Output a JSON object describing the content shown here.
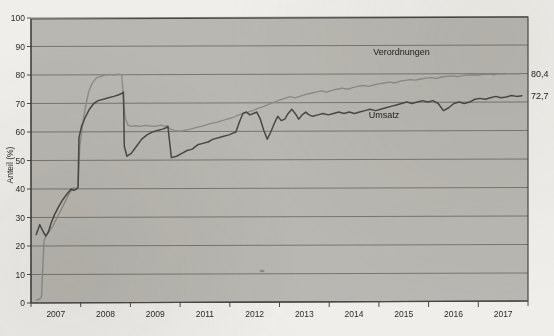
{
  "chart_data": {
    "type": "line",
    "title": "",
    "xlabel": "",
    "ylabel": "Anteil (%)",
    "ylim": [
      0,
      100
    ],
    "yticks": [
      0,
      10,
      20,
      30,
      40,
      50,
      60,
      70,
      80,
      90,
      100
    ],
    "ytick_labels": [
      "0",
      "10",
      "20",
      "30",
      "40",
      "50",
      "60",
      "70",
      "80",
      "90",
      "100"
    ],
    "xtick_labels": [
      "2007",
      "2008",
      "2009",
      "2011",
      "2012",
      "2013",
      "2014",
      "2015",
      "2016",
      "2017"
    ],
    "xlim": [
      2006.5,
      2017.9
    ],
    "grid": true,
    "legend_position": "inline-annotations",
    "annotations": [
      {
        "name": "verordnungen-label",
        "text": "Verordnungen",
        "x": 2015.0,
        "y": 88.0
      },
      {
        "name": "umsatz-label",
        "text": "Umsatz",
        "x": 2014.6,
        "y": 66.0
      },
      {
        "name": "verordnungen-endvalue",
        "text": "80,4",
        "x": 2018.1,
        "y": 80.4
      },
      {
        "name": "umsatz-endvalue",
        "text": "72,7",
        "x": 2018.1,
        "y": 72.7
      }
    ],
    "series": [
      {
        "name": "Verordnungen",
        "end_label": "80,4",
        "final_value": 80.4,
        "color": "#8d8b85",
        "x": [
          2006.62,
          2006.66,
          2006.7,
          2006.74,
          2006.8,
          2006.86,
          2006.92,
          2007.0,
          2007.1,
          2007.2,
          2007.3,
          2007.4,
          2007.48,
          2007.54,
          2007.58,
          2007.62,
          2007.68,
          2007.74,
          2007.82,
          2007.9,
          2008.0,
          2008.1,
          2008.2,
          2008.3,
          2008.4,
          2008.5,
          2008.58,
          2008.62,
          2008.66,
          2008.72,
          2008.8,
          2008.9,
          2009.0,
          2009.12,
          2009.24,
          2009.36,
          2009.48,
          2009.58,
          2009.62,
          2009.7,
          2009.8,
          2009.92,
          2010.04,
          2010.16,
          2010.28,
          2010.4,
          2010.52,
          2010.64,
          2010.76,
          2010.88,
          2011.0,
          2011.12,
          2011.24,
          2011.36,
          2011.48,
          2011.6,
          2011.72,
          2011.84,
          2011.96,
          2012.08,
          2012.2,
          2012.32,
          2012.44,
          2012.56,
          2012.68,
          2012.8,
          2012.92,
          2013.04,
          2013.16,
          2013.28,
          2013.4,
          2013.52,
          2013.64,
          2013.76,
          2013.88,
          2014.0,
          2014.12,
          2014.24,
          2014.36,
          2014.48,
          2014.6,
          2014.72,
          2014.84,
          2014.96,
          2015.08,
          2015.2,
          2015.32,
          2015.44,
          2015.56,
          2015.68,
          2015.8,
          2015.92,
          2016.04,
          2016.16,
          2016.28,
          2016.4,
          2016.52,
          2016.64,
          2016.76,
          2016.88,
          2017.0,
          2017.12,
          2017.24,
          2017.36,
          2017.48,
          2017.6,
          2017.72
        ],
        "y": [
          1.0,
          1.2,
          1.4,
          2.0,
          22.0,
          24.0,
          25.0,
          27.0,
          30.0,
          33.0,
          36.0,
          39.0,
          40.5,
          40.0,
          41.0,
          55.0,
          62.0,
          68.0,
          74.0,
          77.0,
          79.0,
          79.5,
          80.0,
          80.2,
          80.0,
          80.3,
          80.1,
          72.0,
          65.0,
          62.5,
          62.0,
          62.2,
          62.0,
          62.3,
          62.1,
          62.0,
          62.4,
          62.0,
          62.2,
          61.0,
          60.5,
          60.3,
          60.6,
          61.0,
          61.5,
          62.0,
          62.5,
          63.0,
          63.4,
          64.0,
          64.5,
          65.0,
          65.8,
          66.5,
          67.0,
          67.6,
          68.4,
          69.0,
          69.8,
          70.5,
          71.2,
          71.8,
          72.4,
          72.0,
          72.6,
          73.2,
          73.6,
          74.0,
          74.4,
          74.0,
          74.6,
          75.0,
          75.4,
          75.0,
          75.6,
          76.0,
          76.3,
          76.0,
          76.5,
          76.9,
          77.2,
          77.5,
          77.2,
          77.8,
          78.1,
          78.4,
          78.2,
          78.6,
          78.9,
          79.1,
          78.8,
          79.3,
          79.5,
          79.7,
          79.4,
          79.8,
          80.0,
          80.1,
          79.9,
          80.2,
          80.3,
          80.1,
          80.4,
          80.3,
          80.5,
          80.4,
          80.4
        ]
      },
      {
        "name": "Umsatz",
        "end_label": "72,7",
        "final_value": 72.7,
        "color": "#4b4945",
        "x": [
          2006.62,
          2006.7,
          2006.78,
          2006.84,
          2006.9,
          2006.96,
          2007.04,
          2007.14,
          2007.24,
          2007.34,
          2007.42,
          2007.48,
          2007.54,
          2007.58,
          2007.6,
          2007.66,
          2007.74,
          2007.84,
          2007.94,
          2008.04,
          2008.16,
          2008.28,
          2008.4,
          2008.5,
          2008.58,
          2008.62,
          2008.64,
          2008.7,
          2008.8,
          2008.92,
          2009.04,
          2009.16,
          2009.28,
          2009.4,
          2009.52,
          2009.6,
          2009.64,
          2009.72,
          2009.84,
          2009.96,
          2010.08,
          2010.2,
          2010.32,
          2010.44,
          2010.56,
          2010.68,
          2010.8,
          2010.92,
          2011.04,
          2011.12,
          2011.2,
          2011.28,
          2011.36,
          2011.44,
          2011.52,
          2011.6,
          2011.68,
          2011.76,
          2011.84,
          2011.92,
          2012.0,
          2012.08,
          2012.16,
          2012.24,
          2012.32,
          2012.4,
          2012.48,
          2012.56,
          2012.64,
          2012.72,
          2012.8,
          2012.88,
          2012.96,
          2013.08,
          2013.2,
          2013.32,
          2013.44,
          2013.56,
          2013.68,
          2013.8,
          2013.92,
          2014.04,
          2014.16,
          2014.28,
          2014.4,
          2014.52,
          2014.64,
          2014.76,
          2014.88,
          2015.0,
          2015.12,
          2015.24,
          2015.36,
          2015.48,
          2015.6,
          2015.72,
          2015.84,
          2015.96,
          2016.08,
          2016.2,
          2016.32,
          2016.44,
          2016.56,
          2016.68,
          2016.8,
          2016.92,
          2017.04,
          2017.16,
          2017.28,
          2017.4,
          2017.52,
          2017.64,
          2017.76
        ],
        "y": [
          24.0,
          27.5,
          25.0,
          23.5,
          25.0,
          28.0,
          31.0,
          34.0,
          36.5,
          38.5,
          40.0,
          39.5,
          40.0,
          40.5,
          58.0,
          62.0,
          65.0,
          68.0,
          70.0,
          71.0,
          71.5,
          72.0,
          72.5,
          73.0,
          73.5,
          74.0,
          55.0,
          51.5,
          52.5,
          55.0,
          57.5,
          59.0,
          60.0,
          60.5,
          61.0,
          61.5,
          62.0,
          51.0,
          51.5,
          52.5,
          53.5,
          54.0,
          55.5,
          56.0,
          56.5,
          57.5,
          58.0,
          58.5,
          59.0,
          59.5,
          60.0,
          63.5,
          66.5,
          67.0,
          66.0,
          66.5,
          67.0,
          64.5,
          60.5,
          57.5,
          60.0,
          63.0,
          65.5,
          64.0,
          64.5,
          66.5,
          68.0,
          66.5,
          64.5,
          66.0,
          67.0,
          66.0,
          65.5,
          66.0,
          66.5,
          66.0,
          66.5,
          67.0,
          66.5,
          67.0,
          66.5,
          67.0,
          67.5,
          68.0,
          67.5,
          68.0,
          68.5,
          69.0,
          69.5,
          70.0,
          70.5,
          70.0,
          70.5,
          71.0,
          70.5,
          71.0,
          70.0,
          67.5,
          68.5,
          70.0,
          70.5,
          70.0,
          70.5,
          71.5,
          71.8,
          71.5,
          72.0,
          72.5,
          72.0,
          72.3,
          72.8,
          72.5,
          72.7
        ]
      }
    ]
  }
}
